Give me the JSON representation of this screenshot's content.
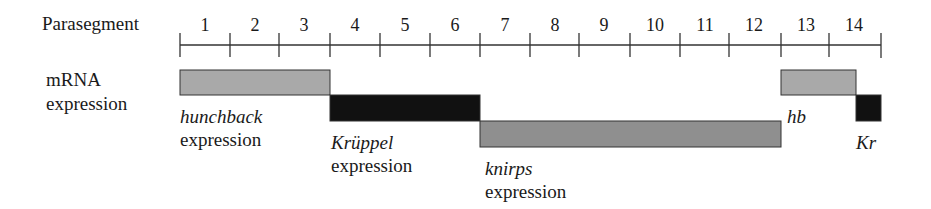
{
  "diagram": {
    "row_label": "Parasegment",
    "y_label_line1": "mRNA",
    "y_label_line2": "expression",
    "parasegments": [
      "1",
      "2",
      "3",
      "4",
      "5",
      "6",
      "7",
      "8",
      "9",
      "10",
      "11",
      "12",
      "13",
      "14"
    ],
    "tick_x": [
      180,
      230,
      279,
      330,
      380,
      430,
      480,
      530,
      579,
      630,
      680,
      729,
      781,
      829,
      881
    ],
    "colors": {
      "light_gray": "#a9a9a9",
      "black": "#111111",
      "mid_gray": "#8f8f8f",
      "line": "#333333"
    },
    "bars": [
      {
        "gene": "hunchback",
        "start_ps": 1,
        "end_ps": 3,
        "x1": 180,
        "x2": 330,
        "y": 70,
        "h": 25,
        "fill": "#a9a9a9"
      },
      {
        "gene": "Krüppel",
        "start_ps": 4,
        "end_ps": 6,
        "x1": 330,
        "x2": 480,
        "y": 95,
        "h": 26,
        "fill": "#111111"
      },
      {
        "gene": "knirps",
        "start_ps": 7,
        "end_ps": 12,
        "x1": 480,
        "x2": 781,
        "y": 121,
        "h": 26,
        "fill": "#8f8f8f"
      },
      {
        "gene": "hb",
        "start_ps": 13,
        "end_ps": 14,
        "x1": 781,
        "x2": 856,
        "y": 70,
        "h": 25,
        "fill": "#a9a9a9"
      },
      {
        "gene": "Kr",
        "start_ps": 14,
        "end_ps": 14,
        "x1": 856,
        "x2": 881,
        "y": 95,
        "h": 26,
        "fill": "#111111"
      }
    ],
    "annotations": {
      "hunchback_gene": "hunchback",
      "hunchback_word": "expression",
      "kruppel_gene": "Krüppel",
      "kruppel_word": "expression",
      "knirps_gene": "knirps",
      "knirps_word": "expression",
      "hb": "hb",
      "kr": "Kr"
    }
  }
}
